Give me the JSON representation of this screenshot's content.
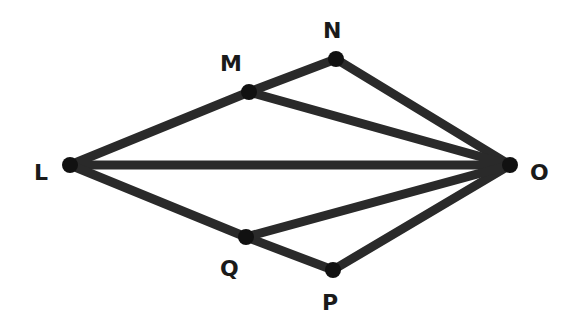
{
  "diagram": {
    "type": "geometry-figure",
    "line_color": "#2a2a2a",
    "point_color": "#111111",
    "points": [
      {
        "id": "L",
        "label": "L",
        "x": 70,
        "y": 165,
        "label_x": 34,
        "label_y": 162
      },
      {
        "id": "M",
        "label": "M",
        "x": 249,
        "y": 92,
        "label_x": 220,
        "label_y": 53
      },
      {
        "id": "N",
        "label": "N",
        "x": 336,
        "y": 59,
        "label_x": 323,
        "label_y": 20
      },
      {
        "id": "O",
        "label": "O",
        "x": 510,
        "y": 165,
        "label_x": 530,
        "label_y": 162
      },
      {
        "id": "Q",
        "label": "Q",
        "x": 246,
        "y": 237,
        "label_x": 220,
        "label_y": 258
      },
      {
        "id": "P",
        "label": "P",
        "x": 333,
        "y": 270,
        "label_x": 322,
        "label_y": 292
      }
    ],
    "segments": [
      [
        "L",
        "M"
      ],
      [
        "M",
        "N"
      ],
      [
        "N",
        "O"
      ],
      [
        "M",
        "O"
      ],
      [
        "L",
        "O"
      ],
      [
        "L",
        "Q"
      ],
      [
        "Q",
        "P"
      ],
      [
        "P",
        "O"
      ],
      [
        "Q",
        "O"
      ]
    ]
  }
}
